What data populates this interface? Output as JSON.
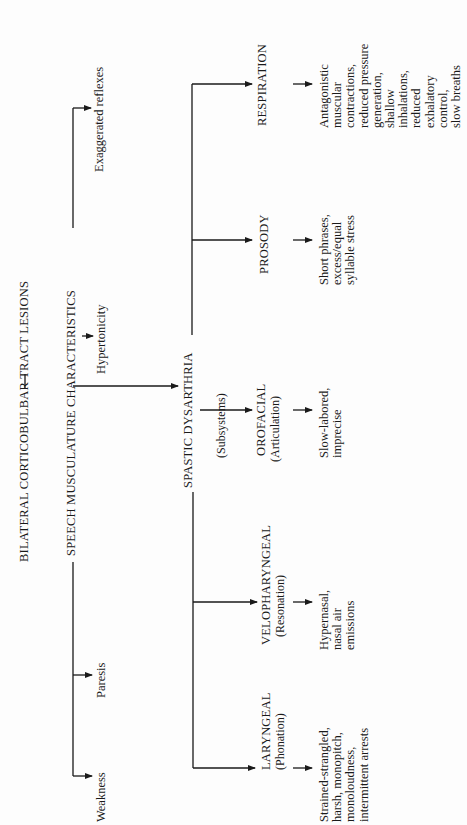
{
  "root": {
    "label": "BILATERAL CORTICOBULBAR TRACT LESIONS"
  },
  "speech_musculature": {
    "label": "SPEECH MUSCULATURE CHARACTERISTICS",
    "children": [
      "Weakness",
      "Paresis",
      "Hypertonicity",
      "Exaggerated reflexes"
    ]
  },
  "spastic_dysarthria": {
    "label": "SPASTIC DYSARTHRIA",
    "note": "(Subsystems)",
    "subsystems": [
      {
        "name": "LARYNGEAL",
        "sub": "(Phonation)",
        "description": [
          "Strained-strangled,",
          "harsh, monopitch,",
          "monoloudness,",
          "intermittent arrests"
        ]
      },
      {
        "name": "VELOPHARYNGEAL",
        "sub": "(Resonation)",
        "description": [
          "Hypernasal,",
          "nasal air",
          "emissions"
        ]
      },
      {
        "name": "OROFACIAL",
        "sub": "(Articulation)",
        "description": [
          "Slow-labored,",
          "imprecise"
        ]
      },
      {
        "name": "PROSODY",
        "sub": "",
        "description": [
          "Short phrases,",
          "excess/equal",
          "syllable stress"
        ]
      },
      {
        "name": "RESPIRATION",
        "sub": "",
        "description": [
          "Antagonistic",
          "muscular",
          "contractions,",
          "reduced pressure",
          "generation,",
          "shallow",
          "inhalations,",
          "reduced",
          "exhalatory",
          "control,",
          "slow breaths"
        ]
      }
    ]
  }
}
